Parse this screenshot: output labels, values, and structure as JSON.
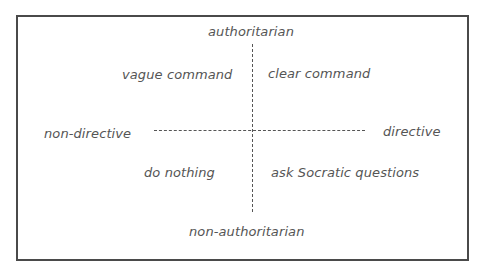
{
  "diagram": {
    "type": "quadrant",
    "axes": {
      "vertical": {
        "top": "authoritarian",
        "bottom": "non-authoritarian"
      },
      "horizontal": {
        "left": "non-directive",
        "right": "directive"
      }
    },
    "quadrants": {
      "top_left": "vague command",
      "top_right": "clear command",
      "bottom_left": "do nothing",
      "bottom_right": "ask Socratic questions"
    },
    "colors": {
      "border": "#4a4a4a",
      "text": "#555555",
      "background": "#ffffff"
    }
  }
}
